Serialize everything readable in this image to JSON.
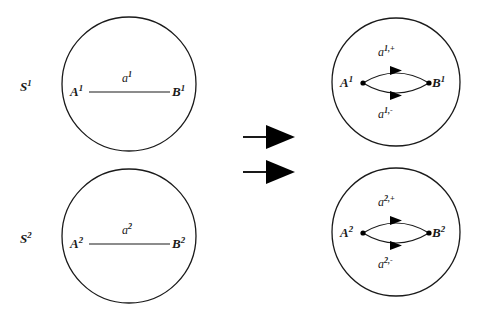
{
  "figure": {
    "type": "diagram",
    "background_color": "#ffffff",
    "stroke_color": "#1a1a1a"
  },
  "sphere_labels": [
    {
      "base": "S",
      "sup": "1"
    },
    {
      "base": "S",
      "sup": "2"
    }
  ],
  "panels": {
    "left_top": {
      "node_a": {
        "base": "A",
        "sup": "1"
      },
      "node_b": {
        "base": "B",
        "sup": "1"
      },
      "edge": {
        "base": "a",
        "sup": "1"
      }
    },
    "left_bottom": {
      "node_a": {
        "base": "A",
        "sup": "2"
      },
      "node_b": {
        "base": "B",
        "sup": "2"
      },
      "edge": {
        "base": "a",
        "sup": "2"
      }
    },
    "right_top": {
      "node_a": {
        "base": "A",
        "sup": "1"
      },
      "node_b": {
        "base": "B",
        "sup": "1"
      },
      "edge_upper": {
        "base": "a",
        "sup": "1,+"
      },
      "edge_lower": {
        "base": "a",
        "sup": "1,-"
      }
    },
    "right_bottom": {
      "node_a": {
        "base": "A",
        "sup": "2"
      },
      "node_b": {
        "base": "B",
        "sup": "2"
      },
      "edge_upper": {
        "base": "a",
        "sup": "2,+"
      },
      "edge_lower": {
        "base": "a",
        "sup": "2,-"
      }
    }
  },
  "transform_arrows": [
    {
      "name": "transform-arrow-top"
    },
    {
      "name": "transform-arrow-bottom"
    }
  ]
}
